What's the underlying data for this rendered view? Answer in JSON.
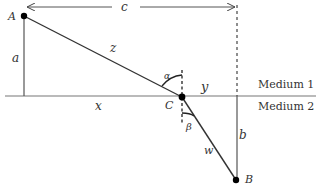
{
  "diagram": {
    "type": "refraction-geometry",
    "points": {
      "A": {
        "label": "A"
      },
      "B": {
        "label": "B"
      },
      "C": {
        "label": "C"
      }
    },
    "segments": {
      "z": "z",
      "w": "w",
      "a": "a",
      "b": "b",
      "c": "c",
      "x": "x",
      "y": "y"
    },
    "angles": {
      "alpha": "α",
      "beta": "β"
    },
    "media": {
      "top": "Medium 1",
      "bottom": "Medium 2"
    },
    "colors": {
      "line": "#333333",
      "point": "#000000",
      "background": "#ffffff"
    }
  }
}
